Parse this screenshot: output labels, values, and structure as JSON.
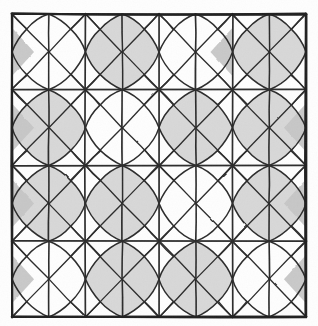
{
  "figure": {
    "medium": "pencil on paper",
    "background_color": "#fefefe",
    "ink_color": "#2b2b2b",
    "shade_color": "#d6d6d6",
    "shade_color_dark": "#c6c6c6",
    "border_color": "#1f1f1f"
  },
  "canvas": {
    "width": 318,
    "height": 326
  },
  "drawing_bounds": {
    "left": 12,
    "top": 14,
    "right": 306,
    "bottom": 317
  },
  "grid": {
    "columns": 8,
    "rows": 8,
    "cell_width": 36.75,
    "cell_height": 37.875,
    "major_columns": 4,
    "major_rows": 4,
    "major_x": [
      12,
      85.5,
      159,
      232.5,
      306
    ],
    "major_y": [
      14,
      89.75,
      165.5,
      241.25,
      317
    ],
    "minor_x": [
      48.75,
      122.25,
      195.75,
      269.25
    ],
    "minor_y": [
      51.875,
      127.625,
      203.375,
      279.125
    ]
  },
  "motif": {
    "name": "four-pointed-star-pinwheel",
    "description": "Each major cell holds a curved four-pointed star formed by arcs bowing between the cell mid-edge nodes, with diagonals radiating to the corners.",
    "star_inset": 0.3,
    "arc_bow": 0.12
  },
  "shading": {
    "note": "Gray filled cells form a diagonal scatter across the tiling.",
    "shaded_stars": [
      [
        1,
        0
      ],
      [
        3,
        0
      ],
      [
        0,
        1
      ],
      [
        2,
        1
      ],
      [
        3,
        1
      ],
      [
        0,
        2
      ],
      [
        1,
        2
      ],
      [
        3,
        2
      ],
      [
        1,
        3
      ],
      [
        2,
        3
      ]
    ],
    "shaded_corners": [
      [
        0,
        0,
        "left"
      ],
      [
        2,
        0,
        "right"
      ],
      [
        0,
        1,
        "left"
      ],
      [
        3,
        1,
        "right"
      ],
      [
        0,
        2,
        "left"
      ],
      [
        3,
        2,
        "right"
      ],
      [
        0,
        3,
        "left"
      ],
      [
        3,
        3,
        "right"
      ]
    ]
  },
  "strokes": {
    "border_width": 2.1,
    "major_width": 1.7,
    "diagonal_width": 1.5,
    "minor_width": 1.0
  }
}
